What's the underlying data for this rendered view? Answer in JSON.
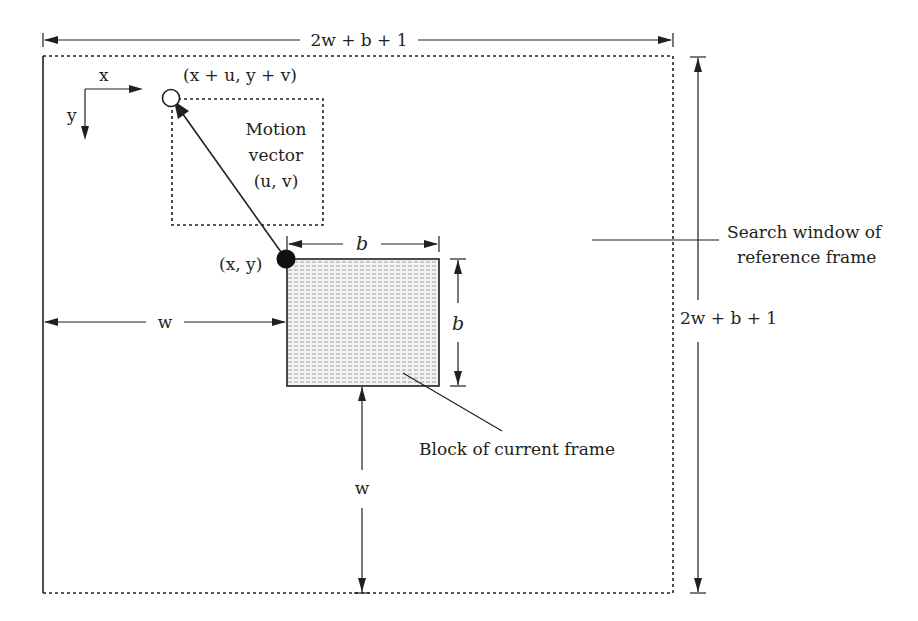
{
  "diagram": {
    "title": "",
    "labels": {
      "top_width": "2w + b + 1",
      "right_height": "2w + b + 1",
      "axis_x": "x",
      "axis_y": "y",
      "target_point": "(x + u, y + v)",
      "motion_vector_line1": "Motion",
      "motion_vector_line2": "vector",
      "motion_vector_line3": "(u, v)",
      "block_origin": "(x, y)",
      "block_width": "b",
      "block_height": "b",
      "left_offset": "w",
      "bottom_offset": "w",
      "search_window_line1": "Search window of",
      "search_window_line2": "reference frame",
      "block_caption": "Block of current frame"
    },
    "colors": {
      "ink": "#231f20",
      "block_fill": "#e6e6e6",
      "background": "#ffffff"
    }
  }
}
